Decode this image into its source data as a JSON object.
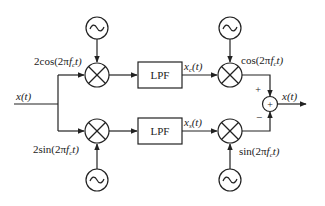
{
  "diagram": {
    "input_label": "x(t)",
    "output_label": "x(t)",
    "top_branch": {
      "carrier_label": "2cos(2πf_c t)",
      "carrier_text_main": "2cos(2π",
      "carrier_text_f": "f",
      "carrier_text_sub": "c",
      "carrier_text_end": "t)",
      "filter_label": "LPF",
      "filter_output_label": "x_c(t)",
      "filter_output_main": "x",
      "filter_output_sub": "c",
      "filter_output_end": "(t)",
      "remod_label": "cos(2πf_c t)",
      "remod_text_main": "cos(2π",
      "remod_text_f": "f",
      "remod_text_sub": "c",
      "remod_text_end": "t)",
      "summer_sign": "+"
    },
    "bottom_branch": {
      "carrier_label": "2sin(2πf_c t)",
      "carrier_text_main": "2sin(2π",
      "carrier_text_f": "f",
      "carrier_text_sub": "c",
      "carrier_text_end": "t)",
      "filter_label": "LPF",
      "filter_output_label": "x_s(t)",
      "filter_output_main": "x",
      "filter_output_sub": "s",
      "filter_output_end": "(t)",
      "remod_label": "sin(2πf_c t)",
      "remod_text_main": "sin(2π",
      "remod_text_f": "f",
      "remod_text_sub": "c",
      "remod_text_end": "t)",
      "summer_sign": "−"
    },
    "summer_symbol": "+",
    "oscillator_symbol": "~",
    "colors": {
      "stroke": "#222222",
      "background": "#ffffff"
    }
  }
}
